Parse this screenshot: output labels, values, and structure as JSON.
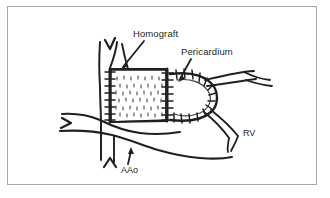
{
  "figure": {
    "background_color": "#ffffff",
    "ink_color": "#231f20",
    "frame_color": "#a8a8a8"
  },
  "labels": {
    "homograft": "Homograft",
    "pericardium": "Pericardium",
    "rv": "RV",
    "aao": "AAo"
  },
  "annotations": [
    {
      "name": "homograft",
      "text": "Homograft",
      "text_x": 133,
      "text_y": 37,
      "leader_from_x": 143,
      "leader_from_y": 41,
      "leader_to_x": 120,
      "leader_to_y": 68,
      "description": "Pulmonary homograft conduit segment, stippled tube"
    },
    {
      "name": "pericardium",
      "text": "Pericardium",
      "text_x": 181,
      "text_y": 55,
      "leader_from_x": 190,
      "leader_from_y": 59,
      "leader_to_x": 176,
      "leader_to_y": 82,
      "description": "Autologous pericardial hood patch over distal anastomosis"
    },
    {
      "name": "aao",
      "text": "AAo",
      "text_x": 121,
      "text_y": 172,
      "leader_from_x": 127,
      "leader_from_y": 162,
      "leader_to_x": 131,
      "leader_to_y": 150,
      "description": "Ascending aorta"
    },
    {
      "name": "rv",
      "text": "RV",
      "text_x": 243,
      "text_y": 135,
      "leader": false,
      "description": "Right ventricle"
    }
  ],
  "structures": {
    "graft_tube": {
      "name": "homograft-conduit",
      "left_suture_x": 109,
      "right_suture_x": 167,
      "top_y": 70,
      "bottom_y": 120,
      "texture": "stipple"
    },
    "pericardial_hood": {
      "name": "pericardium-hood",
      "apex_x": 216,
      "top_y": 74,
      "bottom_y": 120,
      "suture_ticks": 18
    },
    "aorta": {
      "name": "ascending-aorta",
      "orientation": "horizontal",
      "notch_marker": ">"
    },
    "upper_vessel": {
      "name": "upper-vessel-branch",
      "notch_marker": "V"
    },
    "lower_vessel": {
      "name": "lower-vessel-branch",
      "notch_marker": "^"
    },
    "right_vessels": {
      "name": "right-vessel-strands",
      "count": 4
    }
  }
}
